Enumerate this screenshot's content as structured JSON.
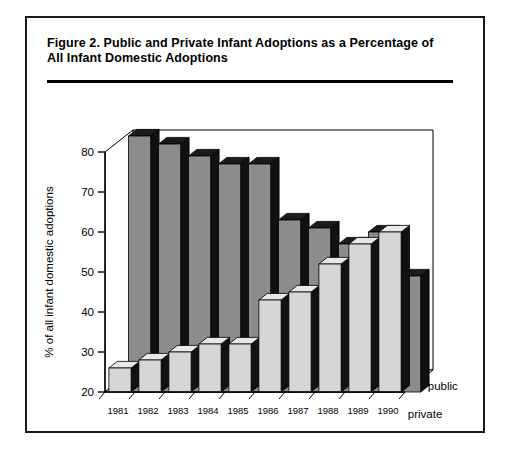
{
  "figure": {
    "number_label": "Figure 2.",
    "title": "Public and Private Infant Adoptions as a Percentage of All Infant Domestic Adoptions",
    "title_line1": "Figure 2.   Public and Private Infant Adoptions as a Percentage of",
    "title_line2": "All Infant Domestic Adoptions"
  },
  "colors": {
    "public_face": "#8c8c8c",
    "public_top": "#1a1a1a",
    "public_side": "#111111",
    "private_face": "#d6d6d6",
    "private_top": "#e8e8e8",
    "private_side": "#111111",
    "axis": "#000000",
    "grid": "#b5b5b5",
    "border": "#1a1a1a",
    "background": "#ffffff"
  },
  "chart_data": {
    "type": "bar",
    "title": "Public and Private Infant Adoptions as a Percentage of All Infant Domestic Adoptions",
    "xlabel": "",
    "ylabel": "% of all infant domestic adoptions",
    "ylim": [
      20,
      80
    ],
    "yticks": [
      20,
      30,
      40,
      50,
      60,
      70,
      80
    ],
    "ytick_labels": [
      "20",
      "30",
      "40",
      "50",
      "60",
      "70",
      "80"
    ],
    "grid": true,
    "grid_axis": "y",
    "legend": [
      "public",
      "private"
    ],
    "legend_position": "right-inside",
    "projection": "3d",
    "categories": [
      "1981",
      "1982",
      "1983",
      "1984",
      "1985",
      "1986",
      "1987",
      "1988",
      "1989",
      "1990"
    ],
    "series": [
      {
        "name": "public",
        "row": "back",
        "values": [
          84,
          82,
          79,
          77,
          77,
          63,
          61,
          57,
          60,
          49
        ]
      },
      {
        "name": "private",
        "row": "front",
        "values": [
          26,
          28,
          30,
          32,
          32,
          43,
          45,
          52,
          57,
          60
        ]
      }
    ]
  },
  "axis": {
    "y_title": "% of all infant domestic adoptions"
  },
  "legend": {
    "public_label": "public",
    "private_label": "private"
  }
}
